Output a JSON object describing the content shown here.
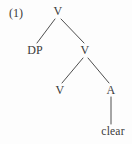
{
  "figure": {
    "example_number": "(1)",
    "type": "syntax-tree",
    "ink_color": "#3a3a3a",
    "background_color": "#fdfdfd",
    "nodes": [
      {
        "id": "v-root",
        "label": "V",
        "x": 58,
        "y": 11
      },
      {
        "id": "dp",
        "label": "DP",
        "x": 35,
        "y": 50
      },
      {
        "id": "v-mid",
        "label": "V",
        "x": 85,
        "y": 50
      },
      {
        "id": "v-leaf",
        "label": "V",
        "x": 60,
        "y": 90
      },
      {
        "id": "a",
        "label": "A",
        "x": 111,
        "y": 90
      },
      {
        "id": "clear",
        "label": "clear",
        "x": 113,
        "y": 131
      }
    ],
    "edges": [
      {
        "id": "edge-root-dp",
        "from": "v-root",
        "to": "dp",
        "x1": 55,
        "y1": 19,
        "x2": 37,
        "y2": 43
      },
      {
        "id": "edge-root-vmid",
        "from": "v-root",
        "to": "v-mid",
        "x1": 61,
        "y1": 19,
        "x2": 84,
        "y2": 43
      },
      {
        "id": "edge-vmid-vleaf",
        "from": "v-mid",
        "to": "v-leaf",
        "x1": 83,
        "y1": 58,
        "x2": 62,
        "y2": 83
      },
      {
        "id": "edge-vmid-a",
        "from": "v-mid",
        "to": "a",
        "x1": 88,
        "y1": 58,
        "x2": 109,
        "y2": 83
      },
      {
        "id": "edge-a-clear",
        "from": "a",
        "to": "clear",
        "x1": 111,
        "y1": 97,
        "x2": 111,
        "y2": 124
      }
    ]
  }
}
